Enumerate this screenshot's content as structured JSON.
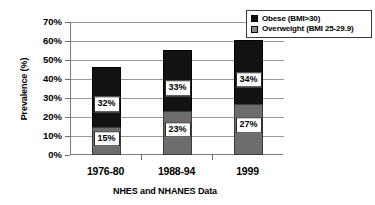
{
  "chart_data": {
    "type": "bar",
    "subtype": "stacked-bar",
    "title": "",
    "xlabel": "NHES and NHANES Data",
    "ylabel": "Prevalence (%)",
    "categories": [
      "1976-80",
      "1988-94",
      "1999"
    ],
    "ylim": [
      0,
      70
    ],
    "ytick_step": 10,
    "ytick_labels": [
      "0%",
      "10%",
      "20%",
      "30%",
      "40%",
      "50%",
      "60%",
      "70%"
    ],
    "ytick_values": [
      0,
      10,
      20,
      30,
      40,
      50,
      60,
      70
    ],
    "grid": true,
    "legend_position": "top-right",
    "series": [
      {
        "name": "Overweight (BMI 25-29.9)",
        "color": "#6d6d6d",
        "values": [
          15,
          23,
          27
        ],
        "labels": [
          "15%",
          "23%",
          "27%"
        ]
      },
      {
        "name": "Obese (BMI>30)",
        "color": "#121212",
        "values": [
          32,
          33,
          34
        ],
        "labels": [
          "32%",
          "33%",
          "34%"
        ]
      }
    ],
    "totals": [
      47,
      56,
      61
    ]
  },
  "legend": {
    "entries": [
      {
        "label": "Obese (BMI>30)",
        "swatch": "legend-swatch-obese"
      },
      {
        "label": "Overweight (BMI 25-29.9)",
        "swatch": "legend-swatch-overweight"
      }
    ]
  },
  "colors": {
    "obese": "#121212",
    "overweight": "#6d6d6d",
    "axis": "#7a7a7a",
    "gridline": "#9a9a9a",
    "background": "#ffffff"
  }
}
